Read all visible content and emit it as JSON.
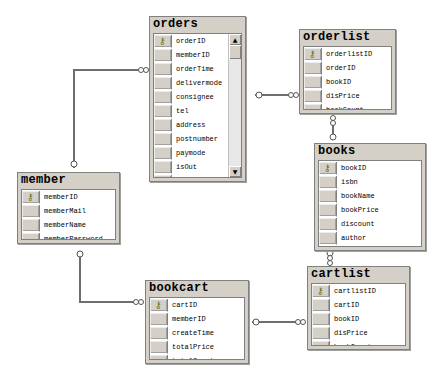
{
  "diagram": {
    "type": "database relationship diagram",
    "tables": [
      {
        "id": "orders",
        "name": "orders",
        "fields": [
          "orderID",
          "memberID",
          "orderTime",
          "delivermode",
          "consignee",
          "tel",
          "address",
          "postnumber",
          "paymode",
          "isOut",
          "totalPrice",
          "totalCount"
        ],
        "primary_key": "orderID",
        "has_scrollbar": true
      },
      {
        "id": "orderlist",
        "name": "orderlist",
        "fields": [
          "orderlistID",
          "orderID",
          "bookID",
          "disPrice",
          "bookCount"
        ],
        "primary_key": "orderlistID"
      },
      {
        "id": "books",
        "name": "books",
        "fields": [
          "bookID",
          "isbn",
          "bookName",
          "bookPrice",
          "discount",
          "author",
          "publisher"
        ],
        "primary_key": "bookID"
      },
      {
        "id": "member",
        "name": "member",
        "fields": [
          "memberID",
          "memberMail",
          "memberName",
          "memberPassword"
        ],
        "primary_key": "memberID"
      },
      {
        "id": "bookcart",
        "name": "bookcart",
        "fields": [
          "cartID",
          "memberID",
          "createTime",
          "totalPrice",
          "totalCount"
        ],
        "primary_key": "cartID"
      },
      {
        "id": "cartlist",
        "name": "cartlist",
        "fields": [
          "cartlistID",
          "cartID",
          "bookID",
          "disPrice",
          "bookCount"
        ],
        "primary_key": "cartlistID"
      }
    ],
    "relationships": [
      {
        "from": "member",
        "to": "orders",
        "one_end": "member",
        "many_end": "orders"
      },
      {
        "from": "orders",
        "to": "orderlist",
        "one_end": "orders",
        "many_end": "orderlist"
      },
      {
        "from": "books",
        "to": "orderlist",
        "one_end": "books",
        "many_end": "orderlist"
      },
      {
        "from": "member",
        "to": "bookcart",
        "one_end": "member",
        "many_end": "bookcart"
      },
      {
        "from": "bookcart",
        "to": "cartlist",
        "one_end": "bookcart",
        "many_end": "cartlist"
      },
      {
        "from": "books",
        "to": "cartlist",
        "one_end": "books",
        "many_end": "cartlist"
      }
    ],
    "icons": {
      "primary_key": "key-icon",
      "scroll_up": "▲",
      "scroll_down": "▼"
    },
    "colors": {
      "table_bg": "#d4d0c8",
      "body_bg": "#ffffff",
      "border": "#808080",
      "line": "#6e6e6e"
    }
  }
}
